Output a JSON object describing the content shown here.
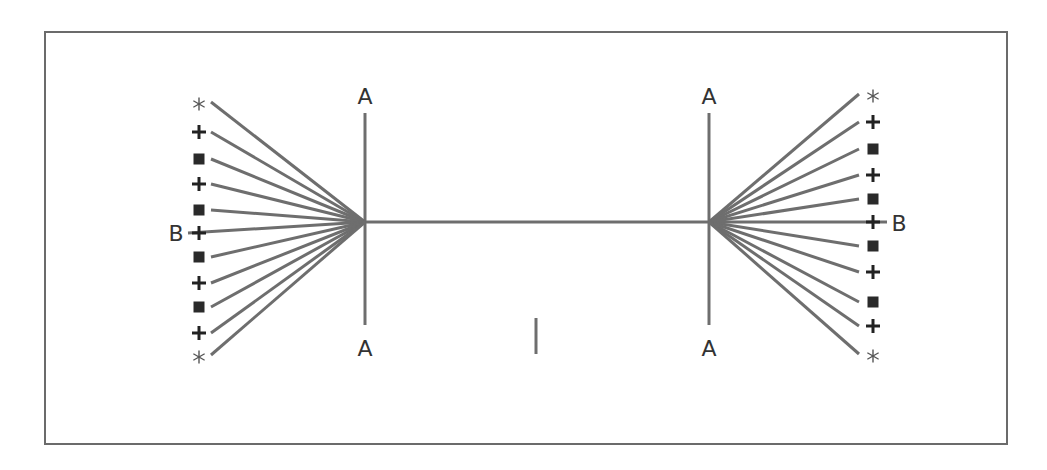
{
  "diagram": {
    "type": "two-hub fan network",
    "frame": {
      "x": 44,
      "y": 31,
      "width": 962,
      "height": 412,
      "color": "#6b6b6b"
    },
    "line_color": "#6e6e6e",
    "marker_color": "#222222",
    "labels": {
      "left_top": "A",
      "left_bottom": "A",
      "right_top": "A",
      "right_bottom": "A",
      "left_side": "B",
      "right_side": "B",
      "center_mark": "I"
    },
    "left_hub": {
      "x": 365,
      "y": 222
    },
    "right_hub": {
      "x": 709,
      "y": 222
    },
    "left_markers": [
      {
        "symbol": "star",
        "x": 199,
        "y": 104
      },
      {
        "symbol": "plus",
        "x": 199,
        "y": 132
      },
      {
        "symbol": "square",
        "x": 199,
        "y": 159
      },
      {
        "symbol": "plus",
        "x": 199,
        "y": 184
      },
      {
        "symbol": "square",
        "x": 199,
        "y": 210
      },
      {
        "symbol": "plus",
        "x": 199,
        "y": 233
      },
      {
        "symbol": "square",
        "x": 199,
        "y": 257
      },
      {
        "symbol": "plus",
        "x": 199,
        "y": 283
      },
      {
        "symbol": "square",
        "x": 199,
        "y": 307
      },
      {
        "symbol": "plus",
        "x": 199,
        "y": 333
      },
      {
        "symbol": "star",
        "x": 199,
        "y": 357
      }
    ],
    "right_markers": [
      {
        "symbol": "star",
        "x": 873,
        "y": 96
      },
      {
        "symbol": "plus",
        "x": 873,
        "y": 122
      },
      {
        "symbol": "square",
        "x": 873,
        "y": 149
      },
      {
        "symbol": "plus",
        "x": 873,
        "y": 175
      },
      {
        "symbol": "square",
        "x": 873,
        "y": 199
      },
      {
        "symbol": "plus",
        "x": 873,
        "y": 222
      },
      {
        "symbol": "square",
        "x": 873,
        "y": 246
      },
      {
        "symbol": "plus",
        "x": 873,
        "y": 272
      },
      {
        "symbol": "square",
        "x": 873,
        "y": 302
      },
      {
        "symbol": "plus",
        "x": 873,
        "y": 326
      },
      {
        "symbol": "star",
        "x": 873,
        "y": 356
      }
    ]
  }
}
